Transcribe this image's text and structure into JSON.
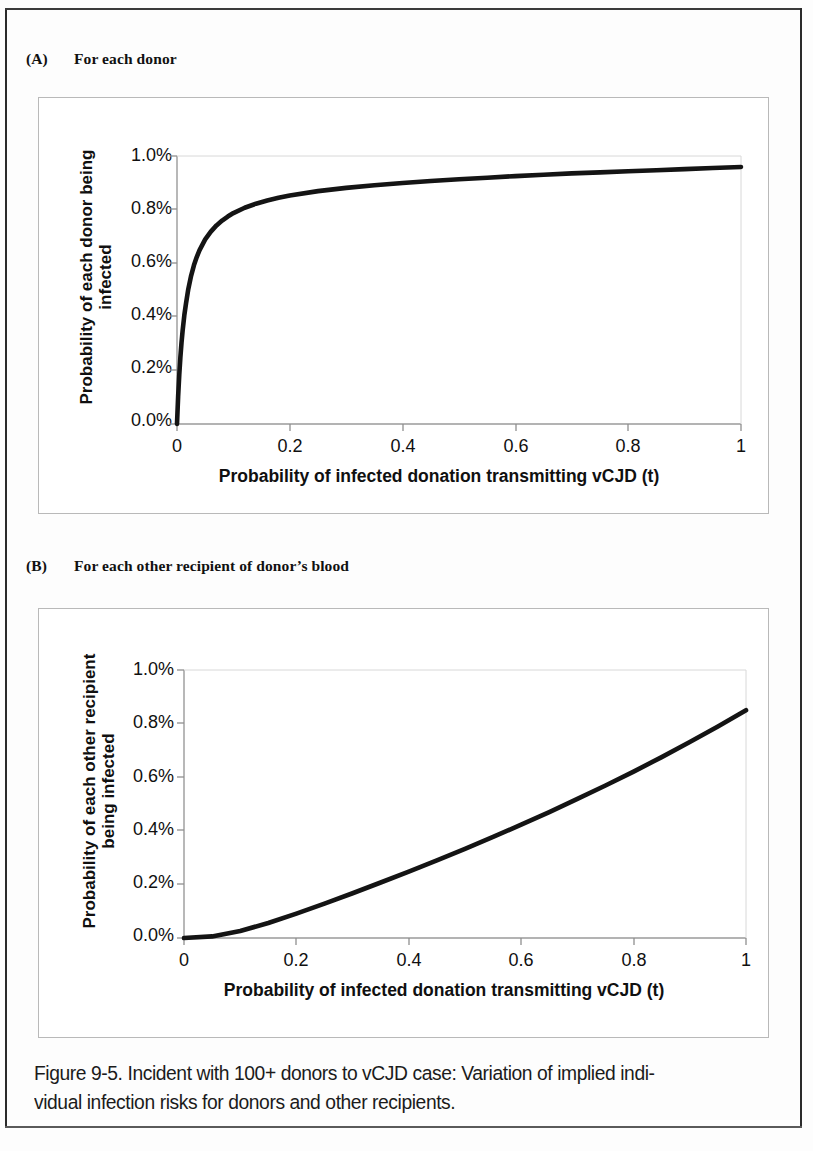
{
  "document": {
    "caption_line_1": "Figure 9-5. Incident with 100+ donors to vCJD case: Variation of implied indi-",
    "caption_line_2": "vidual infection risks for donors and other recipients."
  },
  "panels": [
    {
      "tag": "(A)",
      "title": "For each donor"
    },
    {
      "tag": "(B)",
      "title": "For each other recipient of donor’s blood"
    }
  ],
  "chart_data": [
    {
      "type": "line",
      "title": "For each donor",
      "panel": "(A)",
      "xlabel": "Probability of infected donation transmitting vCJD (t)",
      "ylabel": "Probability of each donor being infected",
      "ylabel_line_1": "Probability of each donor being",
      "ylabel_line_2": "infected",
      "xlim": [
        0,
        1
      ],
      "ylim": [
        0,
        0.01
      ],
      "xticks": [
        0,
        0.2,
        0.4,
        0.6,
        0.8,
        1
      ],
      "xticklabels": [
        "0",
        "0.2",
        "0.4",
        "0.6",
        "0.8",
        "1"
      ],
      "yticks": [
        0,
        0.002,
        0.004,
        0.006,
        0.008,
        0.01
      ],
      "yticklabels": [
        "0.0%",
        "0.2%",
        "0.4%",
        "0.6%",
        "0.8%",
        "1.0%"
      ],
      "grid": false,
      "legend": false,
      "line_color": "#141414",
      "series": [
        {
          "name": "Probability of each donor being infected",
          "x": [
            0,
            0.002,
            0.004,
            0.006,
            0.008,
            0.01,
            0.013,
            0.016,
            0.02,
            0.025,
            0.03,
            0.035,
            0.04,
            0.05,
            0.06,
            0.07,
            0.08,
            0.09,
            0.1,
            0.12,
            0.14,
            0.16,
            0.18,
            0.2,
            0.25,
            0.3,
            0.35,
            0.4,
            0.45,
            0.5,
            0.55,
            0.6,
            0.65,
            0.7,
            0.75,
            0.8,
            0.85,
            0.9,
            0.95,
            1
          ],
          "y": [
            0.0,
            0.00102,
            0.00183,
            0.00249,
            0.00303,
            0.00349,
            0.00406,
            0.0045,
            0.00503,
            0.00553,
            0.00592,
            0.00623,
            0.00649,
            0.00689,
            0.00718,
            0.00741,
            0.00759,
            0.00774,
            0.00787,
            0.00807,
            0.00822,
            0.00834,
            0.00844,
            0.00853,
            0.00869,
            0.00881,
            0.00891,
            0.00899,
            0.00907,
            0.00913,
            0.00919,
            0.00925,
            0.0093,
            0.00935,
            0.00939,
            0.00943,
            0.00947,
            0.00951,
            0.00955,
            0.00959
          ]
        }
      ]
    },
    {
      "type": "line",
      "title": "For each other recipient of donor’s blood",
      "panel": "(B)",
      "xlabel": "Probability of infected donation transmitting vCJD (t)",
      "ylabel": "Probability of each other recipient being infected",
      "ylabel_line_1": "Probability of each other recipient",
      "ylabel_line_2": "being infected",
      "xlim": [
        0,
        1
      ],
      "ylim": [
        0,
        0.01
      ],
      "xticks": [
        0,
        0.2,
        0.4,
        0.6,
        0.8,
        1
      ],
      "xticklabels": [
        "0",
        "0.2",
        "0.4",
        "0.6",
        "0.8",
        "1"
      ],
      "yticks": [
        0,
        0.002,
        0.004,
        0.006,
        0.008,
        0.01
      ],
      "yticklabels": [
        "0.0%",
        "0.2%",
        "0.4%",
        "0.6%",
        "0.8%",
        "1.0%"
      ],
      "grid": false,
      "legend": false,
      "line_color": "#141414",
      "series": [
        {
          "name": "Probability of each other recipient being infected",
          "x": [
            0,
            0.05,
            0.1,
            0.15,
            0.2,
            0.25,
            0.3,
            0.35,
            0.4,
            0.45,
            0.5,
            0.55,
            0.6,
            0.65,
            0.7,
            0.75,
            0.8,
            0.85,
            0.9,
            0.95,
            1
          ],
          "y": [
            0.0,
            6e-05,
            0.00026,
            0.00056,
            0.00091,
            0.00128,
            0.00167,
            0.00207,
            0.00248,
            0.0029,
            0.00333,
            0.00377,
            0.00423,
            0.0047,
            0.00519,
            0.00569,
            0.00621,
            0.00675,
            0.00731,
            0.00789,
            0.0085
          ]
        }
      ]
    }
  ]
}
